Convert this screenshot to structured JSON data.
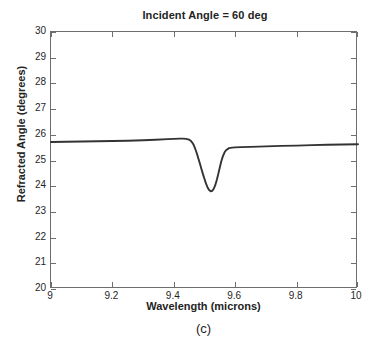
{
  "figure": {
    "panel_caption": "(c)",
    "background_color": "#ffffff",
    "axis_color": "#6e6e6e",
    "curve_color": "#333333"
  },
  "chart_data": {
    "type": "line",
    "title": "Incident Angle = 60  deg",
    "xlabel": "Wavelength (microns)",
    "ylabel": "Refracted Angle (degrees)",
    "xlim": [
      9,
      10
    ],
    "ylim": [
      20,
      30
    ],
    "grid": false,
    "legend": null,
    "xticks": [
      9,
      9.2,
      9.4,
      9.6,
      9.8,
      10
    ],
    "xtick_labels": [
      "9",
      "9.2",
      "9.4",
      "9.6",
      "9.8",
      "10"
    ],
    "yticks": [
      20,
      21,
      22,
      23,
      24,
      25,
      26,
      27,
      28,
      29,
      30
    ],
    "ytick_labels": [
      "20",
      "21",
      "22",
      "23",
      "24",
      "25",
      "26",
      "27",
      "28",
      "29",
      "30"
    ],
    "series": [
      {
        "name": "Refracted Angle",
        "color": "#333333",
        "linewidth": 1.8,
        "x": [
          9.0,
          9.05,
          9.1,
          9.15,
          9.2,
          9.25,
          9.3,
          9.34,
          9.38,
          9.4,
          9.42,
          9.43,
          9.44,
          9.45,
          9.455,
          9.46,
          9.465,
          9.47,
          9.475,
          9.48,
          9.485,
          9.49,
          9.495,
          9.5,
          9.505,
          9.51,
          9.515,
          9.52,
          9.525,
          9.53,
          9.535,
          9.54,
          9.545,
          9.55,
          9.555,
          9.56,
          9.565,
          9.57,
          9.58,
          9.59,
          9.6,
          9.62,
          9.65,
          9.7,
          9.75,
          9.8,
          9.85,
          9.9,
          9.95,
          10.0
        ],
        "y": [
          25.72,
          25.73,
          25.74,
          25.75,
          25.76,
          25.77,
          25.79,
          25.81,
          25.83,
          25.84,
          25.85,
          25.85,
          25.84,
          25.81,
          25.77,
          25.7,
          25.6,
          25.45,
          25.28,
          25.08,
          24.88,
          24.67,
          24.47,
          24.28,
          24.1,
          23.95,
          23.85,
          23.8,
          23.82,
          23.9,
          24.04,
          24.24,
          24.48,
          24.74,
          24.98,
          25.17,
          25.31,
          25.4,
          25.48,
          25.5,
          25.51,
          25.52,
          25.53,
          25.55,
          25.57,
          25.58,
          25.6,
          25.61,
          25.62,
          25.63
        ],
        "annotations": {
          "left_plateau_value": 25.72,
          "pre_dip_peak": {
            "x": 9.425,
            "y": 25.85
          },
          "minimum": {
            "x": 9.52,
            "y": 23.8
          },
          "right_plateau_value": 25.63
        }
      }
    ]
  }
}
